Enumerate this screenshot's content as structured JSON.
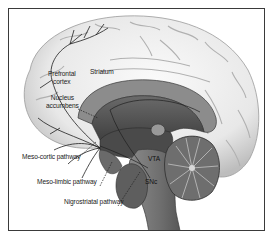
{
  "figure": {
    "type": "sagittal brain section",
    "colors": {
      "frame": "#3a3a3a",
      "cortex_fill": "#ececec",
      "cortex_shadow": "#b8b8b8",
      "deep_structure": "#5a5a5a",
      "brainstem": "#7a7a7a",
      "cerebellum": "#6e6e6e",
      "pathway_line": "#222222",
      "label_text": "#222222"
    }
  },
  "labels": {
    "prefrontal_cortex_line1": "Prefrontal",
    "prefrontal_cortex_line2": "cortex",
    "striatum": "Striatum",
    "nucleus_accumbens_line1": "Nucleus",
    "nucleus_accumbens_line2": "accumbens",
    "vta": "VTA",
    "snc": "SNc",
    "meso_cortic_pathway": "Meso-cortic pathway",
    "meso_limbic_pathway": "Meso-limbic pathway",
    "nigrostriatal_pathway": "Nigrostriatal pathway"
  }
}
